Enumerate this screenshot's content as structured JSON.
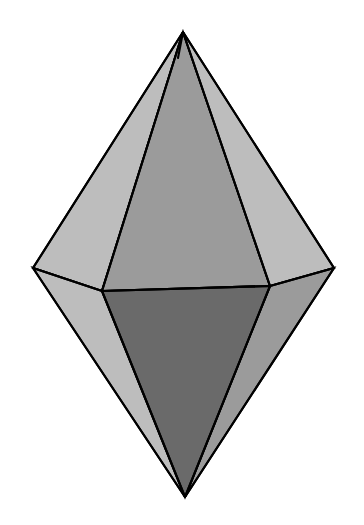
{
  "figure": {
    "name": "pentagonal-bipyramid",
    "background_color": "#ffffff",
    "edge_color": "#000000",
    "edge_width": 2.1,
    "canvas": {
      "width": 364,
      "height": 525
    },
    "palette": {
      "light_gray": "#bdbdbd",
      "mid_gray": "#9b9b9b",
      "mid_dark_gray": "#8f8f8f",
      "dark_gray": "#6a6a6a",
      "darker_gray": "#5f5f5f"
    },
    "vertices": {
      "top_apex": {
        "label": "N",
        "x": 183,
        "y": 32
      },
      "bottom_apex": {
        "label": "S",
        "x": 185,
        "y": 497
      },
      "left": {
        "label": "L",
        "x": 33,
        "y": 268
      },
      "right": {
        "label": "R",
        "x": 334,
        "y": 268
      },
      "front_left": {
        "label": "FL",
        "x": 102,
        "y": 291
      },
      "front_right": {
        "label": "FR",
        "x": 270,
        "y": 286
      },
      "back": {
        "label": "B",
        "x": 183,
        "y": 231
      }
    },
    "faces": [
      {
        "id": "upper-back-left",
        "name": "upper-back-left-face",
        "fill": "#bdbdbd",
        "points": "183,32 33,268 102,291 178,58"
      },
      {
        "id": "upper-left-front",
        "name": "upper-left-front-face",
        "fill": "#9b9b9b",
        "points": "183,32 102,291 178,58"
      },
      {
        "id": "upper-front",
        "name": "upper-front-face",
        "fill": "#9b9b9b",
        "points": "183,32 102,291 270,286"
      },
      {
        "id": "upper-right",
        "name": "upper-right-face",
        "fill": "#bdbdbd",
        "points": "183,32 270,286 334,268"
      },
      {
        "id": "lower-front",
        "name": "lower-front-face",
        "fill": "#6a6a6a",
        "points": "102,291 270,286 185,497"
      },
      {
        "id": "lower-left",
        "name": "lower-left-face",
        "fill": "#bdbdbd",
        "points": "33,268 102,291 185,497"
      },
      {
        "id": "lower-right",
        "name": "lower-right-face",
        "fill": "#9b9b9b",
        "points": "334,268 270,286 185,497"
      }
    ],
    "edges": [
      {
        "id": "equator-front",
        "name": "equator-front-edge",
        "x1": 102,
        "y1": 291,
        "x2": 270,
        "y2": 286
      },
      {
        "id": "equator-left",
        "name": "equator-left-edge",
        "x1": 33,
        "y1": 268,
        "x2": 102,
        "y2": 291
      },
      {
        "id": "equator-right",
        "name": "equator-right-edge",
        "x1": 270,
        "y1": 286,
        "x2": 334,
        "y2": 268
      },
      {
        "id": "top-to-left",
        "name": "top-apex-to-left-edge",
        "x1": 183,
        "y1": 32,
        "x2": 33,
        "y2": 268
      },
      {
        "id": "top-to-front-left",
        "name": "top-apex-to-front-left-edge",
        "x1": 183,
        "y1": 32,
        "x2": 102,
        "y2": 291
      },
      {
        "id": "top-to-back-ridge",
        "name": "top-apex-to-back-ridge-edge",
        "x1": 183,
        "y1": 32,
        "x2": 178,
        "y2": 58
      },
      {
        "id": "top-to-front-right",
        "name": "top-apex-to-front-right-edge",
        "x1": 183,
        "y1": 32,
        "x2": 270,
        "y2": 286
      },
      {
        "id": "top-to-right",
        "name": "top-apex-to-right-edge",
        "x1": 183,
        "y1": 32,
        "x2": 334,
        "y2": 268
      },
      {
        "id": "bottom-to-left",
        "name": "bottom-apex-to-left-edge",
        "x1": 185,
        "y1": 497,
        "x2": 33,
        "y2": 268
      },
      {
        "id": "bottom-to-front-left",
        "name": "bottom-apex-to-front-left-edge",
        "x1": 185,
        "y1": 497,
        "x2": 102,
        "y2": 291
      },
      {
        "id": "bottom-to-front-right",
        "name": "bottom-apex-to-front-right-edge",
        "x1": 185,
        "y1": 497,
        "x2": 270,
        "y2": 286
      },
      {
        "id": "bottom-to-right",
        "name": "bottom-apex-to-right-edge",
        "x1": 185,
        "y1": 497,
        "x2": 334,
        "y2": 268
      }
    ]
  },
  "chart_data": {
    "type": "diagram",
    "subtitle": "",
    "xlabel": "",
    "ylabel": "",
    "legend": [],
    "annotations": [],
    "shape": "pentagonal bipyramid",
    "face_count": 7,
    "visible_face_fills": [
      "#bdbdbd",
      "#9b9b9b",
      "#9b9b9b",
      "#bdbdbd",
      "#6a6a6a",
      "#bdbdbd",
      "#9b9b9b"
    ]
  }
}
